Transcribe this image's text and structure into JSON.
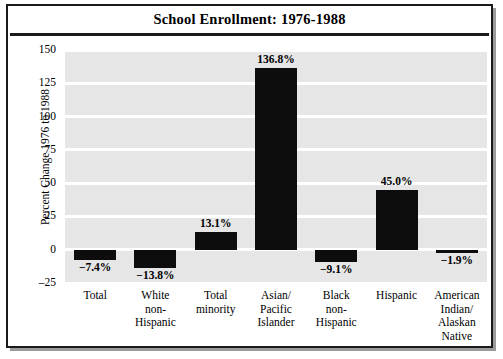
{
  "chart_data": {
    "type": "bar",
    "title": "School Enrollment: 1976-1988",
    "xlabel": "",
    "ylabel": "Percent Change 1976 to 1988",
    "ylim": [
      -25,
      150
    ],
    "yticks": [
      150,
      125,
      100,
      75,
      50,
      25,
      0,
      -25
    ],
    "ytick_labels": [
      "150",
      "125",
      "100",
      "75",
      "50",
      "25",
      "0",
      "–25"
    ],
    "grid": true,
    "legend": null,
    "categories": [
      "Total",
      "White non-Hispanic",
      "Total minority",
      "Asian/Pacific Islander",
      "Black non-Hispanic",
      "Hispanic",
      "American Indian/Alaskan Native"
    ],
    "category_lines": [
      [
        "Total"
      ],
      [
        "White",
        "non-",
        "Hispanic"
      ],
      [
        "Total",
        "minority"
      ],
      [
        "Asian/",
        "Pacific",
        "Islander"
      ],
      [
        "Black",
        "non-",
        "Hispanic"
      ],
      [
        "Hispanic"
      ],
      [
        "American",
        "Indian/",
        "Alaskan",
        "Native"
      ]
    ],
    "values": [
      -7.4,
      -13.8,
      13.1,
      136.8,
      -9.1,
      45.0,
      -1.9
    ],
    "value_labels": [
      "−7.4%",
      "−13.8%",
      "13.1%",
      "136.8%",
      "−9.1%",
      "45.0%",
      "−1.9%"
    ],
    "bar_color": "#0d0d0d",
    "plot_background": "#e6e6e6",
    "gridline_color": "#ffffff",
    "frame_color": "#1a1a1a"
  }
}
